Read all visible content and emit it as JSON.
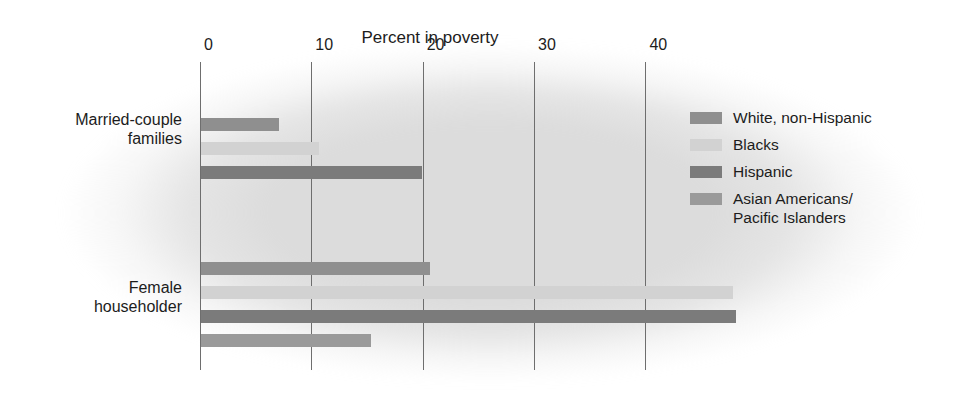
{
  "chart_data": {
    "type": "bar",
    "orientation": "horizontal",
    "title": "Percent in poverty",
    "xlabel": "",
    "ylabel": "",
    "xlim": [
      0,
      44
    ],
    "xticks": [
      0,
      10,
      20,
      30,
      40
    ],
    "xtick_labels": [
      "0",
      "10",
      "20",
      "30",
      "40"
    ],
    "grid": "vertical-only",
    "legend_position": "right",
    "categories": [
      "Married-couple families",
      "Female householder"
    ],
    "series": [
      {
        "name": "White, non-Hispanic",
        "color": "#8f8f8f",
        "values": [
          7.0,
          20.6
        ]
      },
      {
        "name": "Blacks",
        "color": "#d2d2d2",
        "values": [
          10.6,
          47.8
        ]
      },
      {
        "name": "Hispanic",
        "color": "#7b7b7b",
        "values": [
          19.8,
          48.0
        ]
      },
      {
        "name": "Asian Americans/\nPacific Islanders",
        "color": "#9a9a9a",
        "values": [
          null,
          15.3
        ]
      }
    ]
  },
  "axis": {
    "title": "Percent in poverty",
    "ticks": [
      {
        "label": "0",
        "value": 0
      },
      {
        "label": "10",
        "value": 10
      },
      {
        "label": "20",
        "value": 20
      },
      {
        "label": "30",
        "value": 30
      },
      {
        "label": "40",
        "value": 40
      }
    ]
  },
  "categories": [
    {
      "label_line1": "Married-couple",
      "label_line2": "families"
    },
    {
      "label_line1": "Female",
      "label_line2": "householder"
    }
  ],
  "legend": {
    "items": [
      {
        "label": "White, non-Hispanic",
        "color": "#8f8f8f"
      },
      {
        "label": "Blacks",
        "color": "#d2d2d2"
      },
      {
        "label": "Hispanic",
        "color": "#7b7b7b"
      },
      {
        "label": "Asian Americans/\nPacific Islanders",
        "color": "#9a9a9a"
      }
    ]
  },
  "colors": {
    "background": "#ffffff",
    "plot_blob": "#dcdcdc",
    "gridline": "#6e6e6e",
    "text": "#1c1c1c"
  }
}
